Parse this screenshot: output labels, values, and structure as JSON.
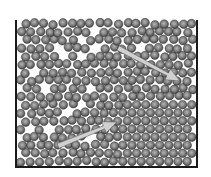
{
  "diagram": {
    "container": {
      "left_x": 16,
      "right_x": 197,
      "top_y": 20,
      "bottom_y": 167,
      "wall_color": "#1a1a1a"
    },
    "spheres": {
      "diameter": 9.2,
      "fill_outer": "#4a4a4a",
      "fill_inner": "#a8a8a8",
      "edge": "#2e2e2e"
    },
    "arrows": [
      {
        "name": "arrow-disordered-region",
        "from": [
          118,
          48
        ],
        "to": [
          180,
          81
        ],
        "color": "#d0d0d0",
        "edge": "#555555"
      },
      {
        "name": "arrow-crystalline-region",
        "from": [
          58,
          146
        ],
        "to": [
          117,
          122
        ],
        "color": "#d0d0d0",
        "edge": "#555555"
      }
    ]
  }
}
